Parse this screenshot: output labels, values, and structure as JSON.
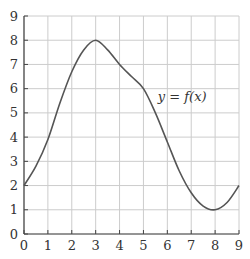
{
  "chart_data": {
    "type": "line",
    "title": "",
    "xlabel": "",
    "ylabel": "",
    "xlim": [
      0,
      9
    ],
    "ylim": [
      0,
      9
    ],
    "grid": true,
    "legend": "none",
    "x_ticks": [
      "0",
      "1",
      "2",
      "3",
      "4",
      "5",
      "6",
      "7",
      "8",
      "9"
    ],
    "y_ticks": [
      "0",
      "1",
      "2",
      "3",
      "4",
      "5",
      "6",
      "7",
      "8",
      "9"
    ],
    "annotations": [
      {
        "text": "y = f(x)",
        "x": 5.6,
        "y": 5.5
      }
    ],
    "series": [
      {
        "name": "y = f(x)",
        "x": [
          0,
          0.5,
          1,
          1.5,
          2,
          2.5,
          3,
          3.5,
          4,
          4.5,
          5,
          5.5,
          6,
          6.5,
          7,
          7.5,
          8,
          8.5,
          9
        ],
        "values": [
          2,
          2.8,
          3.9,
          5.4,
          6.7,
          7.6,
          8,
          7.6,
          7.0,
          6.5,
          6.0,
          5.0,
          3.8,
          2.6,
          1.7,
          1.15,
          1,
          1.3,
          2
        ]
      }
    ]
  },
  "colors": {
    "curve": "#555555",
    "grid": "#cccccc",
    "axis": "#444444",
    "text": "#333333"
  }
}
